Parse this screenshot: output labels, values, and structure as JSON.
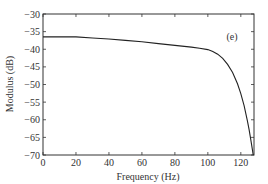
{
  "chart_data": {
    "type": "line",
    "title": "",
    "panel_label": "(e)",
    "xlabel": "Frequency (Hz)",
    "ylabel": "Modulus (dB)",
    "xlim": [
      0,
      128
    ],
    "ylim": [
      -70,
      -30
    ],
    "x_ticks": [
      0,
      20,
      40,
      60,
      80,
      100,
      120
    ],
    "y_ticks": [
      -30,
      -35,
      -40,
      -45,
      -50,
      -55,
      -60,
      -65,
      -70
    ],
    "grid": false,
    "legend": null,
    "series": [
      {
        "name": "Modulus",
        "color": "#222222",
        "x": [
          0,
          10,
          20,
          30,
          40,
          50,
          60,
          70,
          80,
          90,
          95,
          100,
          103,
          106,
          109,
          112,
          115,
          118,
          120,
          122,
          124,
          125,
          126,
          127,
          127.5
        ],
        "y": [
          -36.5,
          -36.5,
          -36.5,
          -36.8,
          -37.1,
          -37.5,
          -37.9,
          -38.4,
          -38.9,
          -39.4,
          -39.7,
          -40.1,
          -40.6,
          -41.4,
          -42.6,
          -44.3,
          -46.6,
          -49.8,
          -52.6,
          -56.0,
          -60.3,
          -62.8,
          -65.5,
          -68.5,
          -70
        ]
      }
    ]
  }
}
